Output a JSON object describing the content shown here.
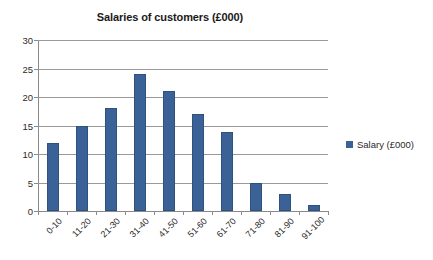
{
  "chart_data": {
    "type": "bar",
    "title": "Salaries of customers (£000)",
    "xlabel": "",
    "ylabel": "",
    "categories": [
      "0-10",
      "11-20",
      "21-30",
      "31-40",
      "41-50",
      "51-60",
      "61-70",
      "71-80",
      "81-90",
      "91-100"
    ],
    "values": [
      12,
      15,
      18,
      24,
      21,
      17,
      13.8,
      5,
      3,
      1
    ],
    "series": [
      {
        "name": "Salary (£000)",
        "values": [
          12,
          15,
          18,
          24,
          21,
          17,
          13.8,
          5,
          3,
          1
        ],
        "color": "#3a6296"
      }
    ],
    "ylim": [
      0,
      30
    ],
    "yticks": [
      0,
      5,
      10,
      15,
      20,
      25,
      30
    ],
    "ytick_labels": [
      "0",
      "5",
      "10",
      "15",
      "20",
      "25",
      "30"
    ],
    "grid": true,
    "grid_axis": "y",
    "legend": {
      "position": "right",
      "entries": [
        {
          "label": "Salary (£000)",
          "color": "#3a6296"
        }
      ]
    },
    "xtick_rotation": -45,
    "background_color": "#ffffff",
    "axis_color": "#8a8a8a",
    "gridline_color": "#9a9a9a",
    "text_color": "#2b2b2b"
  }
}
